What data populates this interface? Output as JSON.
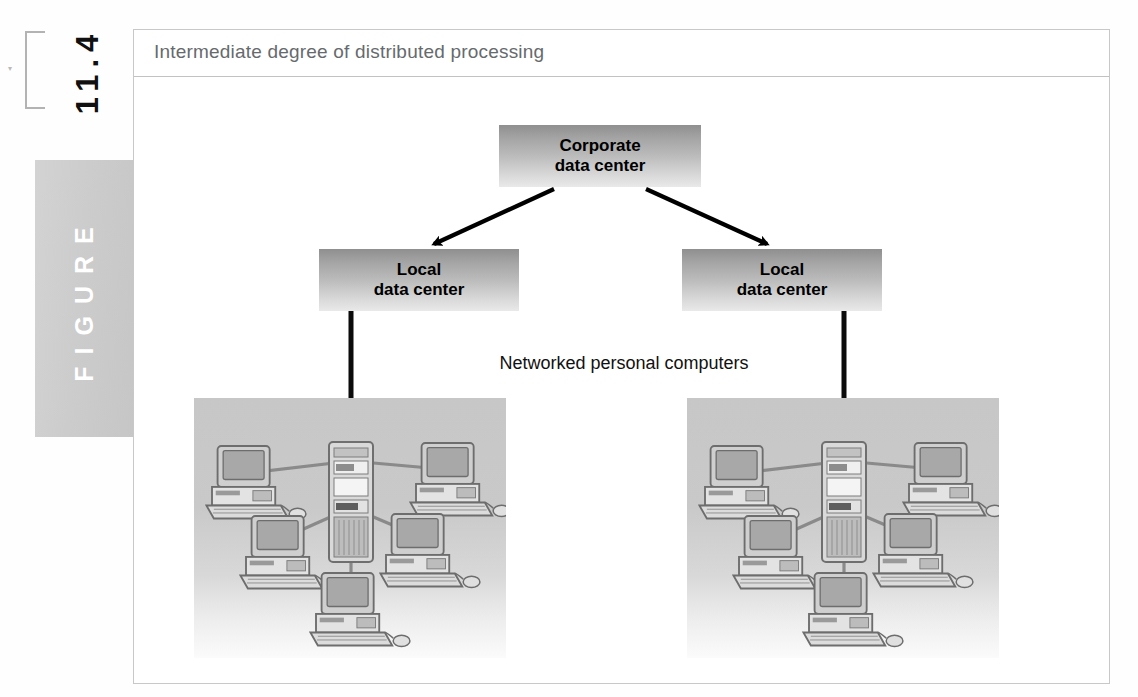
{
  "figure": {
    "number": "11.4",
    "word": "FIGURE",
    "tiny_mark": "▾",
    "title": "Intermediate degree of distributed processing"
  },
  "diagram": {
    "type": "hierarchy-tree",
    "corporate": {
      "line1": "Corporate",
      "line2": "data center"
    },
    "local_left": {
      "line1": "Local",
      "line2": "data center"
    },
    "local_right": {
      "line1": "Local",
      "line2": "data center"
    },
    "network_label": "Networked personal computers",
    "clusters": [
      {
        "name": "left-network-cluster",
        "server": "server-tower",
        "workstations": [
          "pc-top-left",
          "pc-top-right",
          "pc-mid-left",
          "pc-mid-right",
          "pc-bottom-center"
        ]
      },
      {
        "name": "right-network-cluster",
        "server": "server-tower",
        "workstations": [
          "pc-top-left",
          "pc-top-right",
          "pc-mid-left",
          "pc-mid-right",
          "pc-bottom-center"
        ]
      }
    ],
    "connectors": [
      {
        "from": "corporate",
        "to": "local_left",
        "style": "arrow"
      },
      {
        "from": "corporate",
        "to": "local_right",
        "style": "arrow"
      },
      {
        "from": "local_left",
        "to": "left-network-cluster",
        "style": "line"
      },
      {
        "from": "local_right",
        "to": "right-network-cluster",
        "style": "line"
      }
    ]
  },
  "colors": {
    "box_gradient_top": "#8f8f8f",
    "box_gradient_bottom": "#e9e9e9",
    "panel_gray": "#c7c7c7",
    "frame_border": "#c8c8c8",
    "title_text": "#666a6d",
    "figure_tab": "#d3d3d3",
    "arrow": "#000000",
    "link_line": "#8a8a8a"
  }
}
